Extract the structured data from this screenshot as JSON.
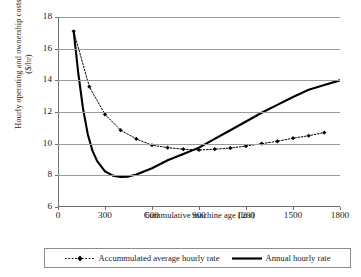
{
  "chart_data": {
    "type": "line",
    "title": "",
    "xlabel": "Cummulative machine age (hrs)",
    "ylabel_line1": "Hourly operating and ownership costs",
    "ylabel_line2": "($/hr)",
    "xlim": [
      0,
      1800
    ],
    "ylim": [
      6,
      18
    ],
    "xticks": [
      0,
      300,
      600,
      900,
      1200,
      1500,
      1800
    ],
    "xtick_labels": [
      "0",
      "300",
      "600",
      "900",
      "1200",
      "1500",
      "1800"
    ],
    "yticks": [
      6,
      8,
      10,
      12,
      14,
      16,
      18
    ],
    "ytick_labels": [
      "6",
      "8",
      "10",
      "12",
      "14",
      "16",
      "18"
    ],
    "grid": "horizontal",
    "legend_position": "below-plot",
    "series": [
      {
        "name": "Accummulated average hourly rate",
        "style": "dotted-with-diamond-markers",
        "color": "#000000",
        "x": [
          100,
          200,
          300,
          400,
          500,
          600,
          700,
          800,
          900,
          1000,
          1100,
          1200,
          1300,
          1400,
          1500,
          1600,
          1700
        ],
        "values": [
          17.1,
          13.6,
          11.85,
          10.85,
          10.3,
          9.9,
          9.75,
          9.65,
          9.6,
          9.65,
          9.72,
          9.85,
          10.0,
          10.15,
          10.35,
          10.5,
          10.7
        ]
      },
      {
        "name": "Annual hourly rate",
        "style": "solid-thick",
        "color": "#000000",
        "x": [
          100,
          130,
          160,
          190,
          220,
          250,
          300,
          350,
          400,
          450,
          500,
          600,
          700,
          800,
          900,
          1000,
          1100,
          1200,
          1300,
          1400,
          1500,
          1600,
          1700,
          1800
        ],
        "values": [
          17.1,
          14.4,
          12.2,
          10.6,
          9.55,
          8.9,
          8.25,
          7.98,
          7.9,
          7.92,
          8.05,
          8.45,
          8.95,
          9.35,
          9.75,
          10.3,
          10.85,
          11.4,
          11.95,
          12.45,
          12.95,
          13.4,
          13.7,
          14.0
        ]
      }
    ],
    "annotations": []
  },
  "legend": {
    "entries": [
      {
        "label": "Accummulated average hourly rate",
        "key": "dotted-diamond-key"
      },
      {
        "label": "Annual hourly rate",
        "key": "solid-line-key"
      }
    ]
  }
}
